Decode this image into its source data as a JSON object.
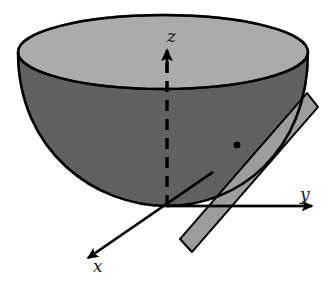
{
  "figure": {
    "kind": "3d-geometry-diagram",
    "background_color": "#ffffff"
  },
  "axes": {
    "origin": {
      "x": 167,
      "y": 206
    },
    "items": [
      {
        "name": "z",
        "label": "z",
        "style": "dashed-through-surface-solid-arrow",
        "direction": "up",
        "tip": {
          "x": 167,
          "y": 48
        },
        "label_pos": {
          "x": 167,
          "y": 28
        }
      },
      {
        "name": "y",
        "label": "y",
        "style": "solid-arrow",
        "direction": "right",
        "tip": {
          "x": 315,
          "y": 206
        },
        "label_pos": {
          "x": 300,
          "y": 186
        }
      },
      {
        "name": "x",
        "label": "x",
        "style": "solid-arrow",
        "direction": "down-left",
        "tip": {
          "x": 85,
          "y": 261
        },
        "label_pos": {
          "x": 93,
          "y": 258
        }
      }
    ]
  },
  "surface": {
    "name": "paraboloid",
    "rim": {
      "cx": 163,
      "cy": 52,
      "rx": 145,
      "ry": 37
    },
    "vertex": {
      "x": 167,
      "y": 206
    },
    "outside_fill": "#9d9d9d",
    "inside_fill": "#d2d2d2",
    "outline_color": "#1a1a1a",
    "outline_width": 2.2
  },
  "tangent_plane": {
    "name": "tangent-plane",
    "fill": "#c9c9c9",
    "outline_color": "#1a1a1a",
    "outline_width": 1.8,
    "corners": [
      {
        "x": 307,
        "y": 93
      },
      {
        "x": 318,
        "y": 107
      },
      {
        "x": 192,
        "y": 252
      },
      {
        "x": 180,
        "y": 239
      }
    ]
  },
  "tangent_point": {
    "name": "tangent-point",
    "x": 237,
    "y": 145,
    "r": 3.2,
    "color": "#1a1a1a"
  },
  "colors": {
    "ink": "#1a1a1a",
    "surface_outside": "#9d9d9d",
    "surface_inside": "#d2d2d2",
    "plane": "#c9c9c9",
    "paper": "#ffffff"
  }
}
